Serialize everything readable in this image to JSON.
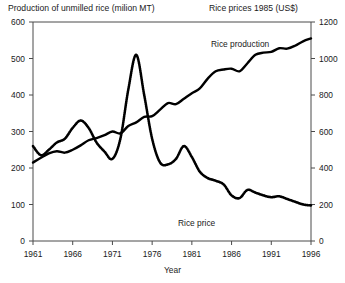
{
  "chart_data": {
    "type": "line",
    "title": "",
    "xlabel": "Year",
    "left_axis_title": "Production of unmilled rice (milion MT)",
    "right_axis_title": "Rice prices 1985 (US$)",
    "grid": false,
    "legend_position": "inline-annotations",
    "xlim": [
      1961,
      1996
    ],
    "xticks": [
      "1961",
      "1966",
      "1971",
      "1976",
      "1981",
      "1986",
      "1991",
      "1996"
    ],
    "xtick_values": [
      1961,
      1966,
      1971,
      1976,
      1981,
      1986,
      1991,
      1996
    ],
    "left_ylim": [
      0,
      600
    ],
    "left_yticks": [
      "0",
      "100",
      "200",
      "300",
      "400",
      "500",
      "600"
    ],
    "left_ytick_values": [
      0,
      100,
      200,
      300,
      400,
      500,
      600
    ],
    "left_ylabel": "Production of unmilled rice (milion MT)",
    "right_ylim": [
      0,
      1200
    ],
    "right_yticks": [
      "0",
      "200",
      "400",
      "600",
      "800",
      "1000",
      "1200"
    ],
    "right_ytick_values": [
      0,
      200,
      400,
      600,
      800,
      1000,
      1200
    ],
    "right_ylabel": "Rice prices 1985 (US$)",
    "x": [
      1961,
      1962,
      1963,
      1964,
      1965,
      1966,
      1967,
      1968,
      1969,
      1970,
      1971,
      1972,
      1973,
      1974,
      1975,
      1976,
      1977,
      1978,
      1979,
      1980,
      1981,
      1982,
      1983,
      1984,
      1985,
      1986,
      1987,
      1988,
      1989,
      1990,
      1991,
      1992,
      1993,
      1994,
      1995,
      1996
    ],
    "series": [
      {
        "name": "Rice production",
        "axis": "left",
        "units": "million MT",
        "style": "solid",
        "color": "#000000",
        "annotation": "Rice production",
        "values": [
          215,
          228,
          240,
          246,
          242,
          250,
          262,
          276,
          282,
          290,
          300,
          295,
          315,
          325,
          340,
          342,
          360,
          378,
          375,
          390,
          405,
          418,
          445,
          465,
          470,
          472,
          465,
          487,
          510,
          516,
          518,
          528,
          527,
          535,
          547,
          555
        ]
      },
      {
        "name": "Rice price",
        "axis": "right",
        "units": "US$ (1985)",
        "style": "dotted",
        "color": "#000000",
        "annotation": "Rice price",
        "values": [
          520,
          470,
          500,
          540,
          560,
          620,
          660,
          620,
          540,
          490,
          450,
          560,
          830,
          1020,
          800,
          560,
          430,
          420,
          450,
          520,
          460,
          380,
          345,
          330,
          310,
          250,
          235,
          280,
          265,
          250,
          240,
          245,
          230,
          215,
          200,
          195
        ]
      }
    ],
    "annotations": [
      {
        "text": "Rice production",
        "series": "Rice production"
      },
      {
        "text": "Rice price",
        "series": "Rice price"
      }
    ]
  }
}
